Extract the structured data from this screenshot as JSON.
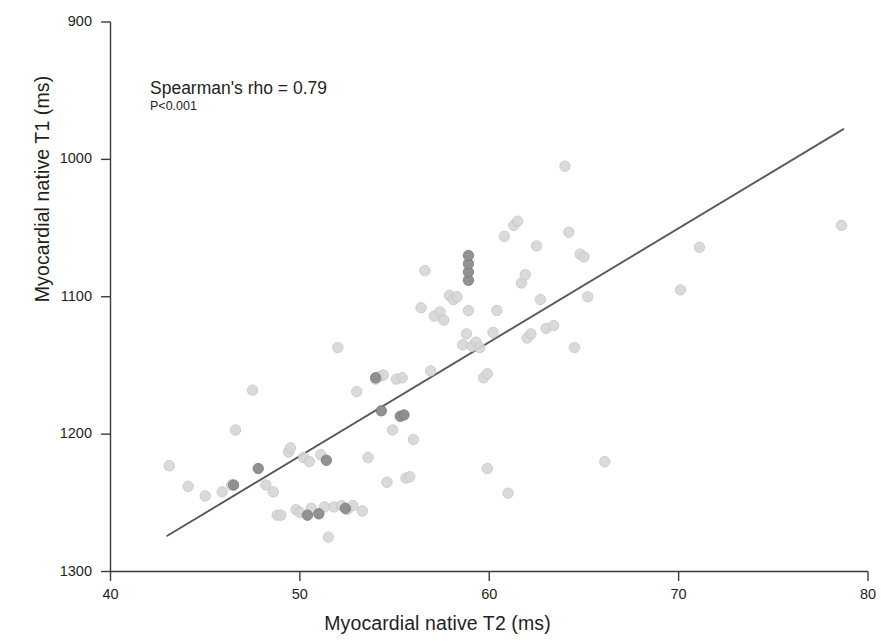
{
  "chart_data": {
    "type": "scatter",
    "title": "",
    "xlabel": "Myocardial native T2 (ms)",
    "ylabel": "Myocardial native T1 (ms)",
    "xlim": [
      40,
      80
    ],
    "ylim": [
      900,
      1300
    ],
    "xticks": [
      40,
      50,
      60,
      70,
      80
    ],
    "yticks": [
      900,
      1000,
      1100,
      1200,
      1300
    ],
    "grid": false,
    "legend": "none",
    "annotations": [
      {
        "text": "Spearman's rho = 0.79",
        "x": 47,
        "y": 1255
      },
      {
        "text": "P<0.001",
        "x": 47,
        "y": 1235
      }
    ],
    "statistics": {
      "spearman_rho": 0.79,
      "p_value": "P<0.001"
    },
    "colors": {
      "marker_light": "#d6d6d6",
      "marker_dark": "#8c8c8c",
      "marker_edge_light": "#c4c4c4",
      "marker_edge_dark": "#7a7a7a",
      "regression_line": "#595959",
      "axis": "#3b3b3b",
      "text": "#231f20",
      "background": "#ffffff"
    },
    "regression_line": {
      "x_start": 43.0,
      "y_start": 926,
      "x_end": 78.7,
      "y_end": 1222
    },
    "series": [
      {
        "name": "light",
        "color": "#d6d6d6",
        "points": [
          [
            43.1,
            977
          ],
          [
            44.1,
            962
          ],
          [
            45.0,
            955
          ],
          [
            45.9,
            958
          ],
          [
            46.4,
            963
          ],
          [
            46.6,
            1003
          ],
          [
            47.5,
            1032
          ],
          [
            48.2,
            963
          ],
          [
            48.6,
            958
          ],
          [
            48.8,
            941
          ],
          [
            49.0,
            941
          ],
          [
            49.4,
            987
          ],
          [
            49.5,
            990
          ],
          [
            49.8,
            945
          ],
          [
            50.0,
            943
          ],
          [
            50.2,
            983
          ],
          [
            50.5,
            980
          ],
          [
            50.6,
            946
          ],
          [
            51.1,
            985
          ],
          [
            51.3,
            947
          ],
          [
            51.5,
            925
          ],
          [
            51.8,
            947
          ],
          [
            52.0,
            1063
          ],
          [
            52.2,
            948
          ],
          [
            52.5,
            945
          ],
          [
            52.8,
            948
          ],
          [
            53.0,
            1031
          ],
          [
            53.3,
            944
          ],
          [
            53.6,
            983
          ],
          [
            54.0,
            1040
          ],
          [
            54.2,
            1042
          ],
          [
            54.4,
            1043
          ],
          [
            54.6,
            965
          ],
          [
            54.9,
            1003
          ],
          [
            55.1,
            1040
          ],
          [
            55.4,
            1041
          ],
          [
            55.6,
            968
          ],
          [
            55.8,
            969
          ],
          [
            56.0,
            996
          ],
          [
            56.4,
            1092
          ],
          [
            56.6,
            1119
          ],
          [
            56.9,
            1046
          ],
          [
            57.1,
            1086
          ],
          [
            57.4,
            1089
          ],
          [
            57.6,
            1083
          ],
          [
            57.9,
            1101
          ],
          [
            58.1,
            1098
          ],
          [
            58.3,
            1100
          ],
          [
            58.6,
            1065
          ],
          [
            58.8,
            1073
          ],
          [
            58.9,
            1090
          ],
          [
            59.1,
            1064
          ],
          [
            59.3,
            1067
          ],
          [
            59.5,
            1063
          ],
          [
            59.7,
            1041
          ],
          [
            59.9,
            1044
          ],
          [
            59.9,
            975
          ],
          [
            60.2,
            1074
          ],
          [
            60.4,
            1090
          ],
          [
            60.8,
            1144
          ],
          [
            61.0,
            957
          ],
          [
            61.3,
            1152
          ],
          [
            61.5,
            1155
          ],
          [
            61.7,
            1110
          ],
          [
            61.9,
            1116
          ],
          [
            62.0,
            1070
          ],
          [
            62.2,
            1073
          ],
          [
            62.5,
            1137
          ],
          [
            62.7,
            1098
          ],
          [
            63.0,
            1077
          ],
          [
            63.4,
            1079
          ],
          [
            64.0,
            1195
          ],
          [
            64.2,
            1147
          ],
          [
            64.5,
            1063
          ],
          [
            64.8,
            1131
          ],
          [
            65.0,
            1129
          ],
          [
            65.2,
            1100
          ],
          [
            66.1,
            980
          ],
          [
            70.1,
            1105
          ],
          [
            71.1,
            1136
          ],
          [
            78.6,
            1152
          ]
        ]
      },
      {
        "name": "dark",
        "color": "#8c8c8c",
        "points": [
          [
            46.5,
            963
          ],
          [
            47.8,
            975
          ],
          [
            50.4,
            941
          ],
          [
            51.0,
            942
          ],
          [
            51.4,
            981
          ],
          [
            52.4,
            946
          ],
          [
            54.0,
            1041
          ],
          [
            54.3,
            1017
          ],
          [
            55.3,
            1013
          ],
          [
            55.5,
            1014
          ],
          [
            58.9,
            1112
          ],
          [
            58.9,
            1118
          ],
          [
            58.9,
            1124
          ],
          [
            58.9,
            1130
          ]
        ]
      }
    ]
  },
  "axis": {
    "x_title": "Myocardial native T2 (ms)",
    "y_title": "Myocardial native T1 (ms)",
    "x_tick_labels": [
      "40",
      "50",
      "60",
      "70",
      "80"
    ],
    "y_tick_labels": [
      "1300",
      "1200",
      "1100",
      "1000",
      "900"
    ]
  },
  "annotation": {
    "rho": "Spearman's rho = 0.79",
    "pvalue": "P<0.001"
  }
}
